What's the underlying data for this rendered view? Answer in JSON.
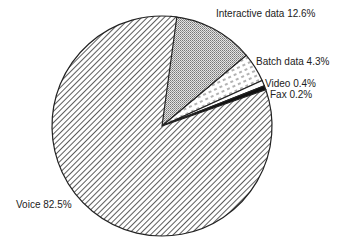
{
  "chart_data": {
    "type": "pie",
    "title": "",
    "slices": [
      {
        "label": "Voice",
        "value": 82.5,
        "pattern": "diagonal-hatch",
        "display": "Voice 82.5%"
      },
      {
        "label": "Interactive data",
        "value": 12.6,
        "pattern": "fine-dots",
        "display": "Interactive data 12.6%"
      },
      {
        "label": "Batch data",
        "value": 4.3,
        "pattern": "dashed-lines",
        "display": "Batch data 4.3%"
      },
      {
        "label": "Video",
        "value": 0.4,
        "pattern": "white",
        "display": "Video 0.4%"
      },
      {
        "label": "Fax",
        "value": 0.2,
        "pattern": "solid-black",
        "display": "Fax 0.2%"
      }
    ],
    "legend": "none (direct labels)"
  },
  "labels": {
    "interactive": "Interactive data 12.6%",
    "batch": "Batch data 4.3%",
    "video": "Video 0.4%",
    "fax": "Fax 0.2%",
    "voice": "Voice 82.5%"
  }
}
